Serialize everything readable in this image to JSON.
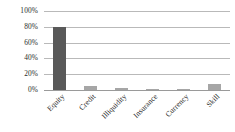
{
  "chart_data": {
    "type": "bar",
    "title": "",
    "xlabel": "",
    "ylabel": "",
    "categories": [
      "Equity",
      "Credit",
      "Illiquidity",
      "Insurance",
      "Currency",
      "Skill"
    ],
    "values": [
      80,
      5,
      3,
      0.5,
      1,
      8
    ],
    "value_labels": [
      "80%",
      "5%",
      "3%",
      "0.5%",
      "1%",
      "8%"
    ],
    "ylim": [
      0,
      100
    ],
    "yticks": [
      0,
      20,
      40,
      60,
      80,
      100
    ],
    "ytick_labels": [
      "0%",
      "20%",
      "40%",
      "60%",
      "80%",
      "100%"
    ],
    "grid": true,
    "legend": false,
    "bar_colors": [
      "#595959",
      "#a6a6a6",
      "#a6a6a6",
      "#a6a6a6",
      "#a6a6a6",
      "#a6a6a6"
    ],
    "gridline_color": "#b9b9b9",
    "axis_color": "#9a9a9a",
    "xtick_rotation": -45
  }
}
